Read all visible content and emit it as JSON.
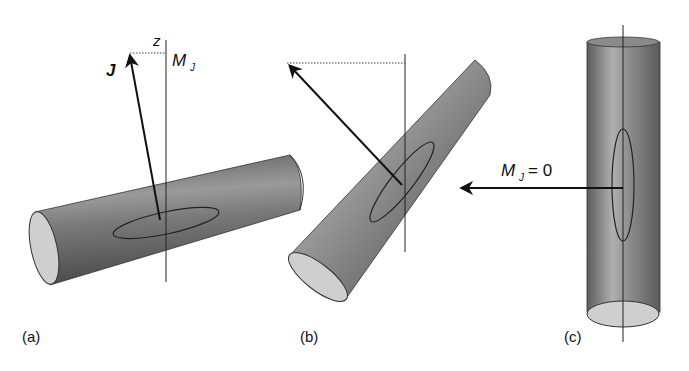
{
  "diagram": {
    "panels": [
      {
        "id": "a",
        "label": "(a)",
        "axis_label": "z",
        "projection_label": "M",
        "projection_sub": "J",
        "vector_label": "J"
      },
      {
        "id": "b",
        "label": "(b)"
      },
      {
        "id": "c",
        "label": "(c)",
        "projection_label": "M",
        "projection_sub": "J",
        "projection_value": "= 0"
      }
    ],
    "colors": {
      "cylinder_dark": "#5a5a5a",
      "cylinder_mid": "#8a8a8a",
      "cylinder_light": "#b8b8b8",
      "end_cap": "#cfcfcf",
      "line": "#111111"
    }
  }
}
